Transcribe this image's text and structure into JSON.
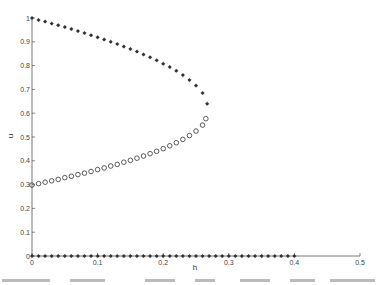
{
  "chart_data": {
    "type": "scatter",
    "title": "",
    "xlabel": "h",
    "ylabel": "u",
    "xlim": [
      0,
      0.5
    ],
    "ylim": [
      0,
      1
    ],
    "xticks": [
      "0",
      "0.1",
      "0.2",
      "0.3",
      "0.4",
      "0.5"
    ],
    "yticks": [
      "0",
      "0.1",
      "0.2",
      "0.3",
      "0.4",
      "0.5",
      "0.6",
      "0.7",
      "0.8",
      "0.9",
      "1"
    ],
    "grid": false,
    "legend": null,
    "series": [
      {
        "name": "upper branch (stars)",
        "marker": "star",
        "x": [
          0,
          0.01,
          0.02,
          0.03,
          0.04,
          0.05,
          0.06,
          0.07,
          0.08,
          0.09,
          0.1,
          0.11,
          0.12,
          0.13,
          0.14,
          0.15,
          0.16,
          0.17,
          0.18,
          0.19,
          0.2,
          0.21,
          0.22,
          0.23,
          0.24,
          0.25,
          0.26,
          0.267
        ],
        "y": [
          1.0,
          0.992,
          0.985,
          0.977,
          0.97,
          0.962,
          0.954,
          0.945,
          0.937,
          0.928,
          0.919,
          0.91,
          0.9,
          0.891,
          0.88,
          0.87,
          0.859,
          0.847,
          0.835,
          0.822,
          0.808,
          0.794,
          0.778,
          0.76,
          0.74,
          0.716,
          0.685,
          0.64
        ]
      },
      {
        "name": "middle branch (circles)",
        "marker": "circle",
        "x": [
          0,
          0.01,
          0.02,
          0.03,
          0.04,
          0.05,
          0.06,
          0.07,
          0.08,
          0.09,
          0.1,
          0.11,
          0.12,
          0.13,
          0.14,
          0.15,
          0.16,
          0.17,
          0.18,
          0.19,
          0.2,
          0.21,
          0.22,
          0.23,
          0.24,
          0.25,
          0.26,
          0.265
        ],
        "y": [
          0.298,
          0.304,
          0.31,
          0.316,
          0.322,
          0.329,
          0.335,
          0.342,
          0.348,
          0.355,
          0.363,
          0.37,
          0.378,
          0.385,
          0.394,
          0.402,
          0.411,
          0.42,
          0.43,
          0.44,
          0.451,
          0.463,
          0.476,
          0.49,
          0.506,
          0.525,
          0.55,
          0.577
        ]
      },
      {
        "name": "zero branch (stars)",
        "marker": "star",
        "x": [
          0,
          0.01,
          0.02,
          0.03,
          0.04,
          0.05,
          0.06,
          0.07,
          0.08,
          0.09,
          0.1,
          0.11,
          0.12,
          0.13,
          0.14,
          0.15,
          0.16,
          0.17,
          0.18,
          0.19,
          0.2,
          0.21,
          0.22,
          0.23,
          0.24,
          0.25,
          0.26,
          0.27,
          0.28,
          0.29,
          0.3,
          0.31,
          0.32,
          0.33,
          0.34,
          0.35,
          0.36,
          0.37,
          0.38,
          0.39,
          0.4
        ],
        "y": [
          0,
          0,
          0,
          0,
          0,
          0,
          0,
          0,
          0,
          0,
          0,
          0,
          0,
          0,
          0,
          0,
          0,
          0,
          0,
          0,
          0,
          0,
          0,
          0,
          0,
          0,
          0,
          0,
          0,
          0,
          0,
          0,
          0,
          0,
          0,
          0,
          0,
          0,
          0,
          0,
          0
        ]
      }
    ]
  },
  "colors": {
    "axis": "#555555",
    "marker": "#333333",
    "caption": "#bbbbbb"
  }
}
